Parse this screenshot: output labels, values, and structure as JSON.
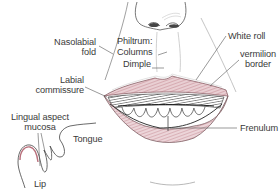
{
  "figure": {
    "colors": {
      "line": "#4a4a4a",
      "vermilion": "#c98f98",
      "vermilion_light": "#e4c3c8",
      "teeth_shadow": "#3d3d3d",
      "label_text": "#3a3a3a"
    }
  },
  "labels": {
    "nasolabial": [
      "Nasolabial",
      "fold"
    ],
    "philtrum": "Philtrum:",
    "columns": "Columns",
    "dimple": "Dimple",
    "white_roll": "White roll",
    "vermilion": [
      "vermilion",
      "border"
    ],
    "labial_commissure": [
      "Labial",
      "commissure"
    ],
    "frenulum": "Frenulum",
    "lingual_aspect": [
      "Lingual aspect",
      "mucosa"
    ],
    "tongue": "Tongue",
    "lip": "Lip"
  }
}
